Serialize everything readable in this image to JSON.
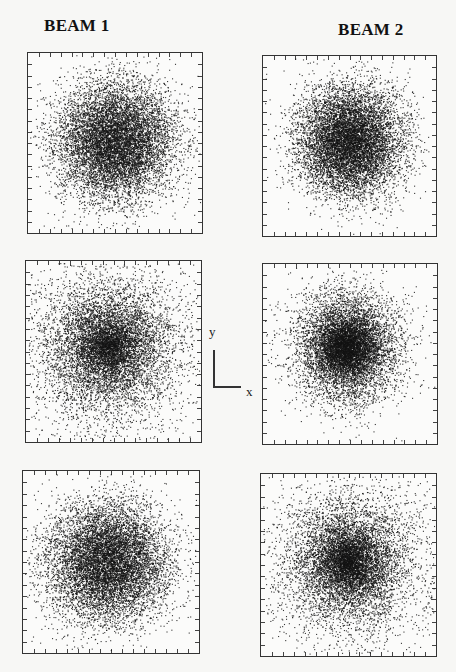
{
  "figure": {
    "columns": [
      {
        "title": "BEAM 1"
      },
      {
        "title": "BEAM 2"
      }
    ],
    "axis_indicator": {
      "x_label": "x",
      "y_label": "y"
    }
  },
  "chart_data": {
    "type": "scatter",
    "xlabel": "x",
    "ylabel": "y",
    "grid": false,
    "tick_labels": false,
    "layout": {
      "rows": 3,
      "cols": 2,
      "column_titles": [
        "BEAM 1",
        "BEAM 2"
      ]
    },
    "panels": [
      {
        "beam": "BEAM 1",
        "row": 1,
        "shape": "gaussian, centrally peaked",
        "center": [
          0.5,
          0.49
        ],
        "sigma": [
          0.17,
          0.16
        ],
        "n_points": 9000,
        "core_density": "high"
      },
      {
        "beam": "BEAM 2",
        "row": 1,
        "shape": "round, uniform core",
        "center": [
          0.5,
          0.47
        ],
        "sigma": [
          0.15,
          0.15
        ],
        "n_points": 9000,
        "core_density": "high"
      },
      {
        "beam": "BEAM 1",
        "row": 2,
        "shape": "round, flattened/wide core",
        "center": [
          0.47,
          0.47
        ],
        "sigma": [
          0.18,
          0.18
        ],
        "n_points": 9000,
        "core_density": "medium"
      },
      {
        "beam": "BEAM 2",
        "row": 2,
        "shape": "gaussian, sharply peaked core",
        "center": [
          0.48,
          0.46
        ],
        "sigma": [
          0.15,
          0.15
        ],
        "n_points": 9000,
        "core_density": "very high"
      },
      {
        "beam": "BEAM 1",
        "row": 3,
        "shape": "gaussian, peaked core",
        "center": [
          0.48,
          0.5
        ],
        "sigma": [
          0.17,
          0.16
        ],
        "n_points": 9000,
        "core_density": "high"
      },
      {
        "beam": "BEAM 2",
        "row": 3,
        "shape": "round, broad core",
        "center": [
          0.5,
          0.48
        ],
        "sigma": [
          0.16,
          0.16
        ],
        "n_points": 9000,
        "core_density": "medium"
      }
    ],
    "ticks_per_side": 16
  }
}
